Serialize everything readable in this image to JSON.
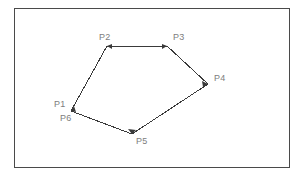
{
  "figure": {
    "type": "polygon-diagram",
    "frame": {
      "x": 14,
      "y": 8,
      "width": 276,
      "height": 160,
      "border_color": "#4a4a4a",
      "background_color": "#ffffff"
    },
    "stroke_color": "#3a3a3a",
    "label_color": "#7d7d7d",
    "vertices": [
      {
        "name": "P1",
        "x": 71,
        "y": 111,
        "label_x": 54,
        "label_y": 99,
        "has_arrowhead": true
      },
      {
        "name": "P2",
        "x": 107,
        "y": 46,
        "label_x": 99,
        "label_y": 32,
        "has_arrowhead": true
      },
      {
        "name": "P3",
        "x": 167,
        "y": 46,
        "label_x": 173,
        "label_y": 32,
        "has_arrowhead": true
      },
      {
        "name": "P4",
        "x": 208,
        "y": 84,
        "label_x": 214,
        "label_y": 73,
        "has_arrowhead": true
      },
      {
        "name": "P5",
        "x": 132,
        "y": 134,
        "label_x": 136,
        "label_y": 136,
        "has_arrowhead": true
      },
      {
        "name": "P6",
        "x": 71,
        "y": 111,
        "label_x": 60,
        "label_y": 113,
        "has_arrowhead": false
      }
    ],
    "edges": [
      {
        "from": "P1",
        "to": "P2"
      },
      {
        "from": "P2",
        "to": "P3"
      },
      {
        "from": "P3",
        "to": "P4"
      },
      {
        "from": "P4",
        "to": "P5"
      },
      {
        "from": "P5",
        "to": "P6"
      }
    ],
    "path_points": "71,111 107,46 167,46 208,84 132,134 71,111"
  }
}
